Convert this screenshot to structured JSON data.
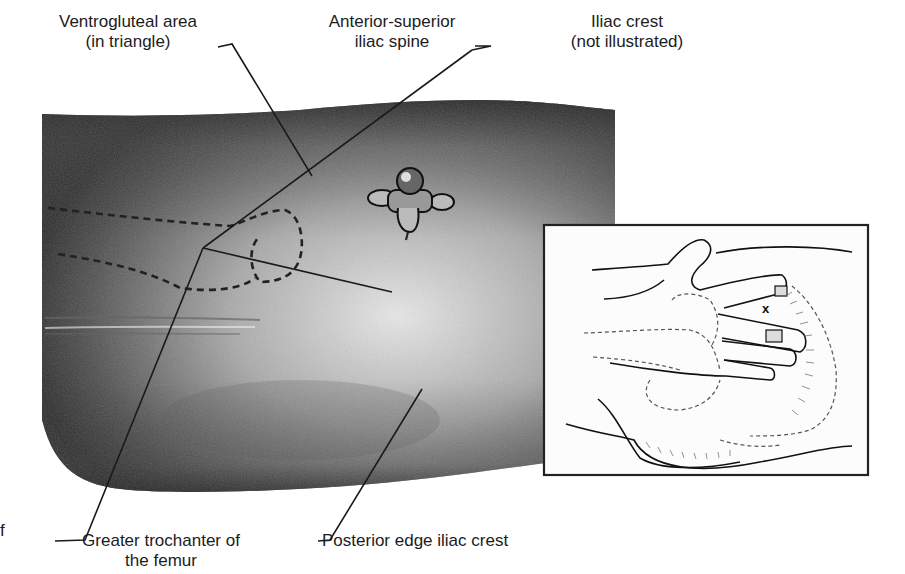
{
  "figure": {
    "labels": {
      "ventrogluteal": {
        "line1": "Ventrogluteal area",
        "line2": "(in triangle)"
      },
      "asis": {
        "line1": "Anterior-superior",
        "line2": "iliac spine"
      },
      "iliac_crest": {
        "line1": "Iliac crest",
        "line2": "(not illustrated)"
      },
      "greater_trochanter": {
        "line1": "Greater trochanter of",
        "line2": "the femur"
      },
      "posterior_edge": {
        "line1": "Posterior edge iliac crest"
      },
      "left_fragment": "f"
    },
    "inset": {
      "description": "Hand placement on hip with index finger on anterior-superior iliac spine; injection site marked",
      "marker": "x"
    },
    "colors": {
      "skin_dark": "#2e2e2e",
      "skin_light": "#d8d8d8",
      "line": "#1a1a1a",
      "inset_border": "#2a2a2a"
    }
  }
}
